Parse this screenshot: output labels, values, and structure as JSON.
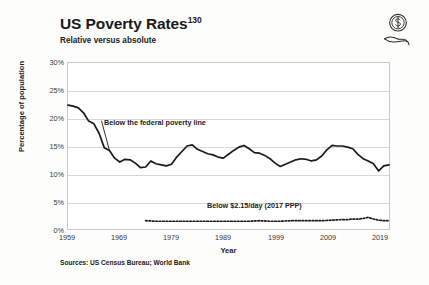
{
  "header": {
    "title": "US Poverty Rates",
    "title_superscript": "130",
    "subtitle": "Relative versus absolute",
    "icon": "hand-holding-coin-icon"
  },
  "source_note": "Sources: US Census Bureau; World Bank",
  "colors": {
    "line": "#1a1a1a",
    "grid": "#d8d8d8",
    "frame": "#c9c9c9",
    "background": "#fdfdfc",
    "text": "#1a1a1a"
  },
  "chart_data": {
    "type": "line",
    "title": "US Poverty Rates",
    "subtitle": "Relative versus absolute",
    "xlabel": "Year",
    "ylabel": "Percentage of population",
    "xlim": [
      1959,
      2021
    ],
    "ylim": [
      0,
      30
    ],
    "grid": true,
    "legend_position": "inline-annotations",
    "xticks": [
      "1959",
      "1969",
      "1979",
      "1989",
      "1999",
      "2009",
      "2019"
    ],
    "xtick_values": [
      1959,
      1969,
      1979,
      1989,
      1999,
      2009,
      2019
    ],
    "yticks": [
      "0%",
      "5%",
      "10%",
      "15%",
      "20%",
      "25%",
      "30%"
    ],
    "ytick_values": [
      0,
      5,
      10,
      15,
      20,
      25,
      30
    ],
    "annotations": [
      {
        "text": "Below the federal poverty line",
        "series": "federal_poverty_line",
        "x": 1967,
        "y": 18.5
      },
      {
        "text": "Below $2.15/day (2017 PPP)",
        "series": "extreme_poverty",
        "x": 1991,
        "y": 4.0
      }
    ],
    "series": [
      {
        "name": "Below the federal poverty line",
        "style": "solid",
        "x": [
          1959,
          1960,
          1961,
          1962,
          1963,
          1964,
          1965,
          1966,
          1967,
          1968,
          1969,
          1970,
          1971,
          1972,
          1973,
          1974,
          1975,
          1976,
          1977,
          1978,
          1979,
          1980,
          1981,
          1982,
          1983,
          1984,
          1985,
          1986,
          1987,
          1988,
          1989,
          1990,
          1991,
          1992,
          1993,
          1994,
          1995,
          1996,
          1997,
          1998,
          1999,
          2000,
          2001,
          2002,
          2003,
          2004,
          2005,
          2006,
          2007,
          2008,
          2009,
          2010,
          2011,
          2012,
          2013,
          2014,
          2015,
          2016,
          2017,
          2018,
          2019,
          2020,
          2021
        ],
        "values": [
          22.4,
          22.2,
          21.9,
          21.0,
          19.5,
          19.0,
          17.3,
          14.7,
          14.2,
          12.8,
          12.1,
          12.6,
          12.5,
          11.9,
          11.1,
          11.2,
          12.3,
          11.8,
          11.6,
          11.4,
          11.7,
          13.0,
          14.0,
          15.0,
          15.2,
          14.4,
          14.0,
          13.6,
          13.4,
          13.0,
          12.8,
          13.5,
          14.2,
          14.8,
          15.1,
          14.5,
          13.8,
          13.7,
          13.3,
          12.7,
          11.9,
          11.3,
          11.7,
          12.1,
          12.5,
          12.7,
          12.6,
          12.3,
          12.5,
          13.2,
          14.3,
          15.1,
          15.0,
          15.0,
          14.8,
          14.5,
          13.5,
          12.7,
          12.3,
          11.8,
          10.5,
          11.4,
          11.6
        ]
      },
      {
        "name": "Below $2.15/day (2017 PPP)",
        "style": "dotted",
        "x": [
          1974,
          1976,
          1978,
          1980,
          1982,
          1984,
          1986,
          1988,
          1990,
          1992,
          1994,
          1996,
          1998,
          2000,
          2002,
          2004,
          2006,
          2008,
          2010,
          2012,
          2013,
          2014,
          2015,
          2016,
          2017,
          2018,
          2019,
          2020,
          2021
        ],
        "values": [
          1.5,
          1.4,
          1.4,
          1.4,
          1.4,
          1.4,
          1.4,
          1.4,
          1.4,
          1.4,
          1.4,
          1.5,
          1.4,
          1.4,
          1.5,
          1.5,
          1.5,
          1.5,
          1.6,
          1.7,
          1.7,
          1.8,
          1.8,
          1.9,
          2.1,
          1.8,
          1.6,
          1.5,
          1.5
        ]
      }
    ]
  }
}
